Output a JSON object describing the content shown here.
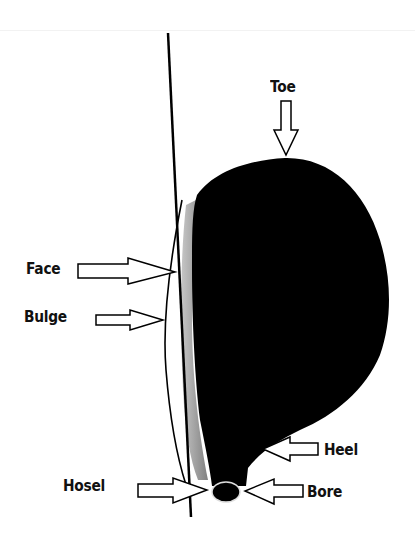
{
  "diagram": {
    "labels": {
      "toe": "Toe",
      "face": "Face",
      "bulge": "Bulge",
      "heel": "Heel",
      "hosel": "Hosel",
      "bore": "Bore"
    },
    "colors": {
      "head_fill": "#000000",
      "outline": "#000000",
      "background": "#ffffff",
      "face_shadow": "#8a8a8a"
    }
  }
}
